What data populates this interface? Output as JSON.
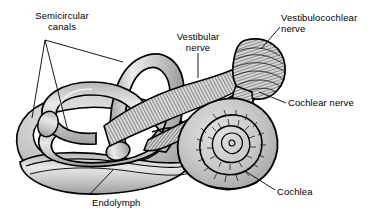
{
  "figure": {
    "background_color": "#ffffff",
    "line_color": "#000000",
    "fill_light": "#d2d2d2",
    "fill_mid": "#bdbdbd",
    "fill_dark": "#9a9a9a",
    "fill_white": "#ffffff",
    "hatch_color": "#1a1a1a"
  },
  "labels": [
    {
      "id": "semicircular-canals",
      "text": "Semicircular\ncanals",
      "x": 14,
      "y": 10,
      "width": 96,
      "align": "center"
    },
    {
      "id": "vestibular-nerve",
      "text": "Vestibular\nnerve",
      "x": 166,
      "y": 31,
      "width": 64,
      "align": "center"
    },
    {
      "id": "vestibulocochlear-nerve",
      "text": "Vestibulocochlear\nnerve",
      "x": 281,
      "y": 12,
      "width": 92,
      "align": "left"
    },
    {
      "id": "cochlear-nerve",
      "text": "Cochlear nerve",
      "x": 288,
      "y": 97,
      "width": 85,
      "align": "left"
    },
    {
      "id": "cochlea",
      "text": "Cochlea",
      "x": 277,
      "y": 186,
      "width": 55,
      "align": "left"
    },
    {
      "id": "endolymph",
      "text": "Endolymph",
      "x": 92,
      "y": 197,
      "width": 66,
      "align": "left"
    }
  ],
  "leader_lines": [
    {
      "id": "semicircular-canals-leader-1",
      "points": "45,40 32,118"
    },
    {
      "id": "semicircular-canals-leader-2",
      "points": "45,40 68,131"
    },
    {
      "id": "semicircular-canals-leader-3",
      "points": "45,40 123,62"
    },
    {
      "id": "vestibular-nerve-leader",
      "points": "198,53 198,78"
    },
    {
      "id": "vestibulocochlear-nerve-leader",
      "points": "280,27 261,49"
    },
    {
      "id": "cochlear-nerve-leader",
      "points": "286,103 259,92"
    },
    {
      "id": "cochlea-leader",
      "points": "275,190 245,171"
    },
    {
      "id": "endolymph-leader",
      "points": "90,194 113,170"
    }
  ],
  "structures": [
    {
      "id": "semicircular-canal-anterior",
      "kind": "loop"
    },
    {
      "id": "semicircular-canal-posterior",
      "kind": "loop"
    },
    {
      "id": "semicircular-canal-lateral",
      "kind": "loop"
    },
    {
      "id": "vestibule",
      "kind": "chamber"
    },
    {
      "id": "utricle-saccule",
      "kind": "chamber"
    },
    {
      "id": "endolymphatic-duct",
      "kind": "duct"
    },
    {
      "id": "vestibular-nerve-bundle",
      "kind": "nerve"
    },
    {
      "id": "cochlear-nerve-bundle",
      "kind": "nerve"
    },
    {
      "id": "vestibulocochlear-nerve-trunk",
      "kind": "nerve"
    },
    {
      "id": "cochlea-spiral",
      "kind": "spiral"
    }
  ]
}
